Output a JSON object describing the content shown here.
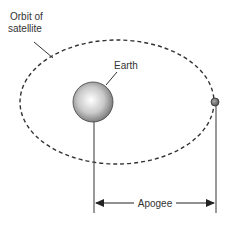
{
  "diagram": {
    "labels": {
      "orbit_line1": "Orbit of",
      "orbit_line2": "satellite",
      "earth": "Earth",
      "apogee": "Apogee"
    },
    "colors": {
      "line": "#444444",
      "earth_light": "#ffffff",
      "earth_dark": "#6f6f6f",
      "satellite": "#707070"
    }
  }
}
